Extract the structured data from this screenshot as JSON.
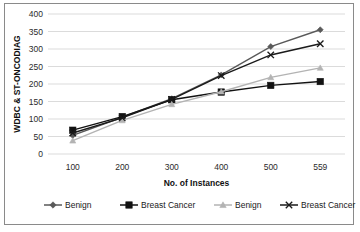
{
  "chart_data": {
    "type": "line",
    "title": "",
    "xlabel": "No. of Instances",
    "ylabel": "WDBC & ST-ONCODIAG",
    "categories": [
      "100",
      "200",
      "300",
      "400",
      "500",
      "559"
    ],
    "x_tick_labels": [
      "100",
      "200",
      "300",
      "400",
      "500",
      "559"
    ],
    "y_tick_labels": [
      "0",
      "50",
      "100",
      "150",
      "200",
      "250",
      "300",
      "350",
      "400"
    ],
    "ylim": [
      0,
      400
    ],
    "y_step": 50,
    "grid": true,
    "legend_position": "bottom",
    "series": [
      {
        "name": "Benign",
        "marker": "diamond",
        "color": "#595959",
        "values": [
          53,
          105,
          158,
          226,
          307,
          355
        ]
      },
      {
        "name": "Breast Cancer",
        "marker": "square",
        "color": "#121212",
        "values": [
          68,
          107,
          155,
          177,
          196,
          207
        ]
      },
      {
        "name": "Benign",
        "marker": "triangle",
        "color": "#b3b3b3",
        "values": [
          38,
          96,
          142,
          178,
          219,
          246
        ]
      },
      {
        "name": "Breast Cancer",
        "marker": "x",
        "color": "#1a1a1a",
        "values": [
          60,
          103,
          156,
          224,
          283,
          315
        ]
      }
    ]
  },
  "axes": {
    "y_title": "WDBC & ST-ONCODIAG",
    "x_title": "No. of Instances",
    "y_ticks": [
      "400",
      "350",
      "300",
      "250",
      "200",
      "150",
      "100",
      "50",
      "0"
    ],
    "x_ticks": [
      "100",
      "200",
      "300",
      "400",
      "500",
      "559"
    ]
  },
  "legend": {
    "items": [
      {
        "label": "Benign",
        "marker": "diamond",
        "color": "#595959"
      },
      {
        "label": "Breast Cancer",
        "marker": "square",
        "color": "#121212"
      },
      {
        "label": "Benign",
        "marker": "triangle",
        "color": "#b3b3b3"
      },
      {
        "label": "Breast Cancer",
        "marker": "x",
        "color": "#1a1a1a"
      }
    ]
  },
  "colors": {
    "grid": "#d2d2d2",
    "frame": "#8a8a8a",
    "background": "#ffffff",
    "text": "#1a1a1a"
  }
}
